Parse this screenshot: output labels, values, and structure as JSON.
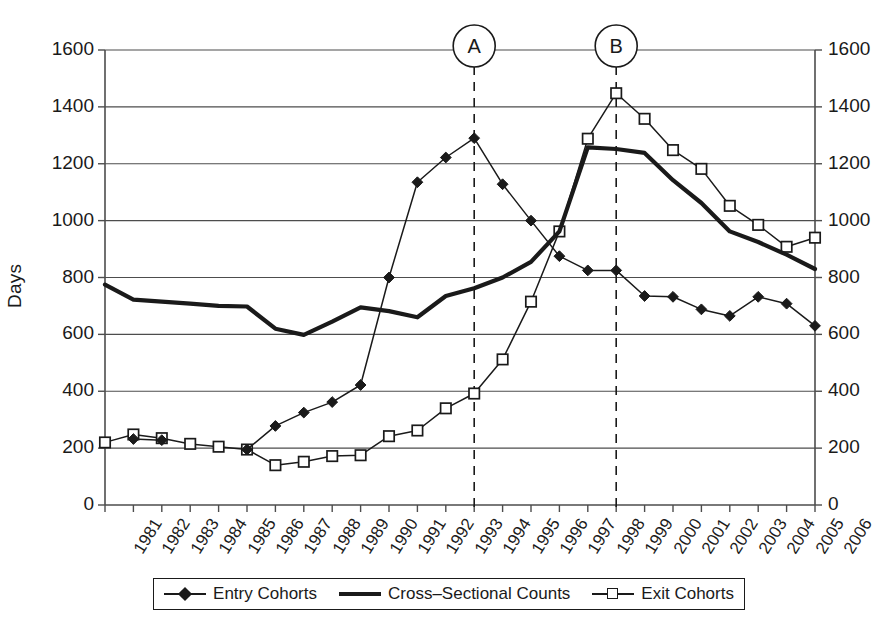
{
  "chart_data": {
    "type": "line",
    "title": "",
    "xlabel": "",
    "ylabel": "Days",
    "ylim": [
      0,
      1600
    ],
    "ytick_step": 200,
    "grid": true,
    "dual_y_axis": true,
    "legend_position": "bottom",
    "x": [
      "1981",
      "1982",
      "1983",
      "1984",
      "1985",
      "1986",
      "1987",
      "1988",
      "1989",
      "1990",
      "1991",
      "1992",
      "1993",
      "1994",
      "1995",
      "1996",
      "1997",
      "1998",
      "1999",
      "2000",
      "2001",
      "2002",
      "2003",
      "2004",
      "2005",
      "2006"
    ],
    "yticks": [
      "0",
      "200",
      "400",
      "600",
      "800",
      "1000",
      "1200",
      "1400",
      "1600"
    ],
    "series": [
      {
        "name": "Entry Cohorts",
        "marker": "filled-diamond",
        "line": "thin",
        "values": [
          null,
          232,
          228,
          null,
          null,
          195,
          278,
          325,
          362,
          422,
          800,
          1135,
          1222,
          1290,
          1128,
          1000,
          875,
          825,
          825,
          735,
          732,
          688,
          665,
          732,
          708,
          630
        ]
      },
      {
        "name": "Cross–Sectional Counts",
        "marker": "none",
        "line": "thick",
        "values": [
          775,
          722,
          715,
          708,
          700,
          698,
          620,
          598,
          645,
          695,
          682,
          660,
          735,
          762,
          800,
          855,
          962,
          1258,
          1252,
          1238,
          1142,
          1062,
          962,
          925,
          880,
          830
        ]
      },
      {
        "name": "Exit Cohorts",
        "marker": "open-square",
        "line": "thin",
        "values": [
          220,
          248,
          235,
          215,
          205,
          195,
          140,
          152,
          172,
          175,
          242,
          262,
          340,
          392,
          512,
          715,
          962,
          1288,
          1448,
          1358,
          1248,
          1182,
          1052,
          985,
          908,
          940
        ]
      }
    ],
    "annotations": [
      {
        "label": "A",
        "x": "1994",
        "type": "circled-marker-with-dashed-line"
      },
      {
        "label": "B",
        "x": "1999",
        "type": "circled-marker-with-dashed-line"
      }
    ]
  },
  "legend": {
    "items": [
      {
        "label": "Entry Cohorts",
        "icon": "filled-diamond-line-swatch"
      },
      {
        "label": "Cross–Sectional Counts",
        "icon": "thick-line-swatch"
      },
      {
        "label": "Exit Cohorts",
        "icon": "open-square-line-swatch"
      }
    ]
  }
}
